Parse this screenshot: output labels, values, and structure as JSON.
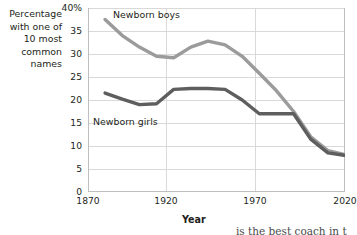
{
  "chart_data": {
    "type": "line",
    "title": "",
    "ylabel": "Percentage with one of 10 most common names",
    "xlabel": "Year",
    "xlim": [
      1870,
      2020
    ],
    "ylim": [
      0,
      40
    ],
    "grid": true,
    "legend": "inline-labels",
    "x_ticks": [
      "1870",
      "1920",
      "1970",
      "2020"
    ],
    "y_ticks": [
      "40%",
      "35",
      "30",
      "25",
      "20",
      "15",
      "10",
      "5",
      "0"
    ],
    "series": [
      {
        "name": "Newborn boys",
        "color": "#9b9b9b",
        "x": [
          1880,
          1890,
          1900,
          1910,
          1920,
          1930,
          1940,
          1950,
          1960,
          1970,
          1980,
          1990,
          2000,
          2010,
          2020
        ],
        "values": [
          37.5,
          34.0,
          31.5,
          29.5,
          29.2,
          31.5,
          32.8,
          32.0,
          29.5,
          25.8,
          22.0,
          17.5,
          12.0,
          9.0,
          8.2
        ]
      },
      {
        "name": "Newborn girls",
        "color": "#5e5e5e",
        "x": [
          1880,
          1890,
          1900,
          1910,
          1920,
          1930,
          1940,
          1950,
          1960,
          1970,
          1980,
          1990,
          2000,
          2010,
          2020
        ],
        "values": [
          21.5,
          20.2,
          19.0,
          19.2,
          22.3,
          22.5,
          22.5,
          22.3,
          20.0,
          17.0,
          17.0,
          17.0,
          11.5,
          8.5,
          8.0
        ]
      }
    ]
  },
  "axis": {
    "y_caption_lines": [
      "Percentage",
      "with one of",
      "10 most",
      "common",
      "names"
    ],
    "y_ticks": [
      {
        "label": "40%",
        "value": 40
      },
      {
        "label": "35",
        "value": 35
      },
      {
        "label": "30",
        "value": 30
      },
      {
        "label": "25",
        "value": 25
      },
      {
        "label": "20",
        "value": 20
      },
      {
        "label": "15",
        "value": 15
      },
      {
        "label": "10",
        "value": 10
      },
      {
        "label": "5",
        "value": 5
      },
      {
        "label": "0",
        "value": 0
      }
    ],
    "x_ticks": [
      {
        "label": "1870",
        "value": 1870
      },
      {
        "label": "1920",
        "value": 1920
      },
      {
        "label": "1970",
        "value": 1970
      },
      {
        "label": "2020",
        "value": 2020
      }
    ],
    "x_title": "Year"
  },
  "series_labels": {
    "boys": "Newborn boys",
    "girls": "Newborn girls"
  },
  "colors": {
    "boys_line": "#9b9b9b",
    "girls_line": "#5e5e5e",
    "grid": "#d9d9d9",
    "axis": "#bfbfbf",
    "text": "#231f20"
  },
  "page_bleed": {
    "text": "is the best coach in t"
  }
}
